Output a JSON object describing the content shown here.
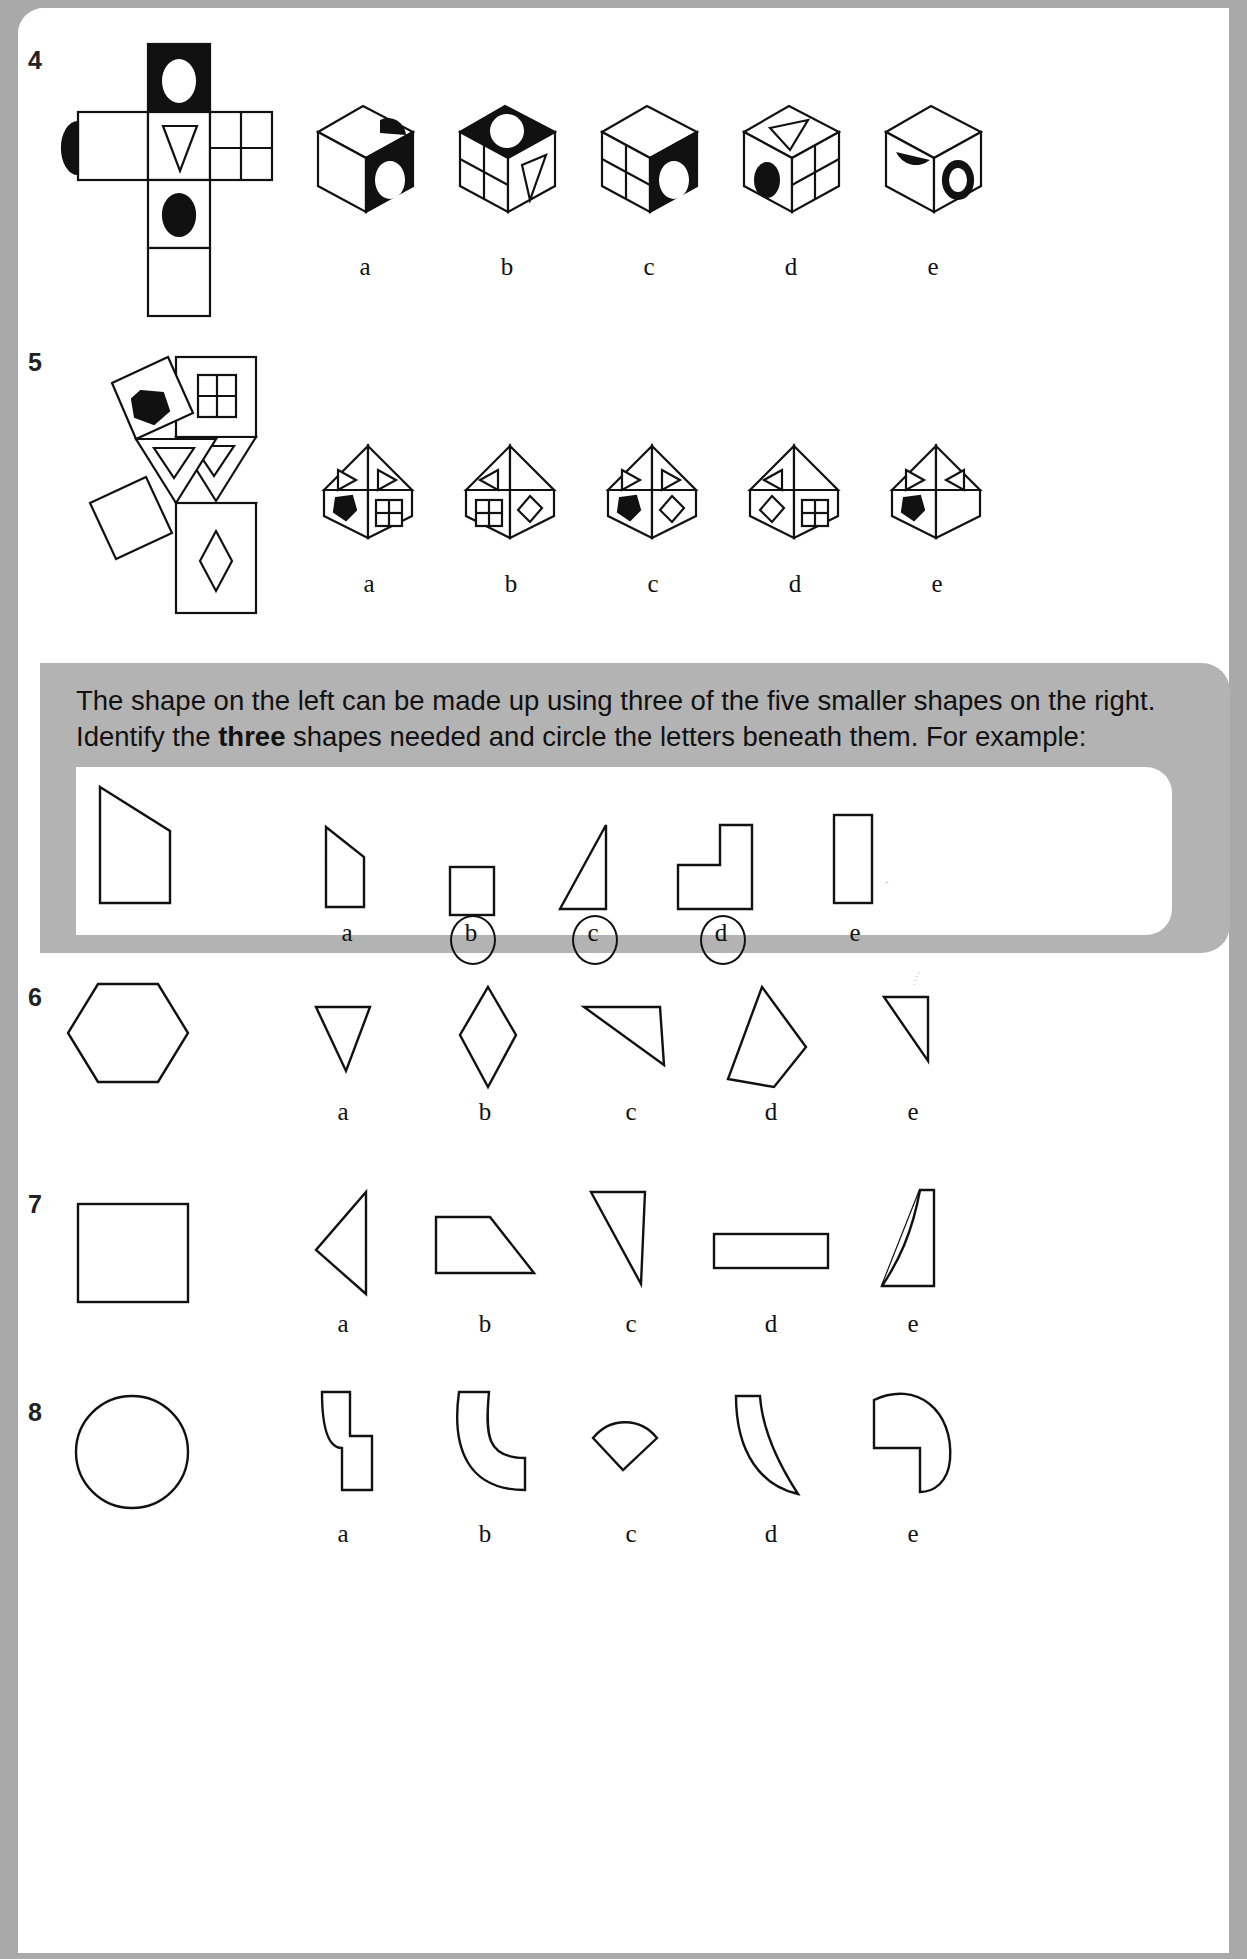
{
  "page": {
    "background_color": "#a9a9a9",
    "sheet_color": "#ffffff",
    "ink_color": "#111111"
  },
  "questions": [
    {
      "number": "4",
      "type": "cube-net-folding",
      "net": {
        "description": "cross-shaped cube net",
        "faces": [
          {
            "position": "top",
            "fill": "black",
            "motif": "white-ellipse"
          },
          {
            "position": "middle-left",
            "fill": "white",
            "motif": "black-half-ellipse-left-edge"
          },
          {
            "position": "middle-centre",
            "fill": "white",
            "motif": "outline-triangle-down"
          },
          {
            "position": "middle-right",
            "fill": "white",
            "motif": "four-pane-grid"
          },
          {
            "position": "lower-centre",
            "fill": "white",
            "motif": "black-ellipse"
          },
          {
            "position": "bottom-centre",
            "fill": "white",
            "motif": "blank"
          }
        ]
      },
      "options": [
        {
          "letter": "a",
          "top_face": "white with black half-circle at right",
          "left_face": "white blank",
          "right_face": "black with white ellipse"
        },
        {
          "letter": "b",
          "top_face": "black with white circle",
          "left_face": "white four-pane grid",
          "right_face": "white with outline triangle"
        },
        {
          "letter": "c",
          "top_face": "white blank",
          "left_face": "white four-pane grid",
          "right_face": "black with white ellipse"
        },
        {
          "letter": "d",
          "top_face": "white with outline triangle",
          "left_face": "white with black ellipse",
          "right_face": "white four-pane grid"
        },
        {
          "letter": "e",
          "top_face": "white with black half-circle",
          "left_face": "white blank",
          "right_face": "white with black ring ellipse"
        }
      ],
      "option_letters": [
        "a",
        "b",
        "c",
        "d",
        "e"
      ]
    },
    {
      "number": "5",
      "type": "octahedron-net-folding",
      "net": {
        "description": "net of square and triangle faces",
        "faces": [
          {
            "position": "upper-square",
            "motif": "four-pane-window"
          },
          {
            "position": "left-tilted-square",
            "motif": "black-hexagon"
          },
          {
            "position": "triangle-upper-right",
            "motif": "outline-triangle-down"
          },
          {
            "position": "triangle-centre",
            "motif": "outline-triangle-down"
          },
          {
            "position": "triangle-lower",
            "motif": "outline-triangle-down"
          },
          {
            "position": "lower-left-square",
            "motif": "blank"
          },
          {
            "position": "lower-right-square",
            "motif": "outline-diamond"
          }
        ]
      },
      "options": [
        {
          "letter": "a",
          "roof_left": "triangle pointing right",
          "roof_right": "triangle pointing right",
          "body_left": "black hexagon",
          "body_right": "four-pane window"
        },
        {
          "letter": "b",
          "roof_left": "triangle pointing left",
          "roof_right": "blank",
          "body_left": "four-pane window",
          "body_right": "outline diamond"
        },
        {
          "letter": "c",
          "roof_left": "triangle pointing right",
          "roof_right": "triangle pointing right",
          "body_left": "black hexagon",
          "body_right": "outline diamond"
        },
        {
          "letter": "d",
          "roof_left": "triangle pointing left",
          "roof_right": "blank",
          "body_left": "outline diamond",
          "body_right": "four-pane window"
        },
        {
          "letter": "e",
          "roof_left": "triangle pointing right",
          "roof_right": "triangle pointing left",
          "body_left": "black hexagon",
          "body_right": "blank"
        }
      ],
      "option_letters": [
        "a",
        "b",
        "c",
        "d",
        "e"
      ]
    },
    {
      "number": "6",
      "type": "shape-composition",
      "target_shape": "hexagon",
      "options": [
        {
          "letter": "a",
          "shape": "downward triangle"
        },
        {
          "letter": "b",
          "shape": "tall rhombus"
        },
        {
          "letter": "c",
          "shape": "thin scalene triangle"
        },
        {
          "letter": "d",
          "shape": "tall quadrilateral kite"
        },
        {
          "letter": "e",
          "shape": "right triangle"
        }
      ],
      "option_letters": [
        "a",
        "b",
        "c",
        "d",
        "e"
      ]
    },
    {
      "number": "7",
      "type": "shape-composition",
      "target_shape": "square",
      "options": [
        {
          "letter": "a",
          "shape": "leftward pointing triangle"
        },
        {
          "letter": "b",
          "shape": "right trapezium"
        },
        {
          "letter": "c",
          "shape": "right triangle apex top-left"
        },
        {
          "letter": "d",
          "shape": "long thin rectangle"
        },
        {
          "letter": "e",
          "shape": "hooked L-curve polygon"
        }
      ],
      "option_letters": [
        "a",
        "b",
        "c",
        "d",
        "e"
      ]
    },
    {
      "number": "8",
      "type": "shape-composition",
      "target_shape": "circle",
      "options": [
        {
          "letter": "a",
          "shape": "zig-zag stepped polygon"
        },
        {
          "letter": "b",
          "shape": "quarter-ring hook"
        },
        {
          "letter": "c",
          "shape": "small circular sector"
        },
        {
          "letter": "d",
          "shape": "crescent lens segment"
        },
        {
          "letter": "e",
          "shape": "three-quarter pac-man sector"
        }
      ],
      "option_letters": [
        "a",
        "b",
        "c",
        "d",
        "e"
      ]
    }
  ],
  "instruction": {
    "line1": "The shape on the left can be made up using three of the five smaller shapes on the",
    "line2_pre": "right. Identify the ",
    "line2_bold": "three",
    "line2_post": " shapes needed and circle the letters beneath them. For example:",
    "background_color": "#b3b3b3"
  },
  "example": {
    "target_shape": "large right-trapezium block",
    "options": [
      {
        "letter": "a",
        "shape": "small trapezium",
        "circled": false
      },
      {
        "letter": "b",
        "shape": "small rectangle",
        "circled": true
      },
      {
        "letter": "c",
        "shape": "thin right triangle",
        "circled": true
      },
      {
        "letter": "d",
        "shape": "L-shaped polygon",
        "circled": true
      },
      {
        "letter": "e",
        "shape": "tall narrow rectangle",
        "circled": false
      }
    ],
    "letters": [
      "a",
      "b",
      "c",
      "d",
      "e"
    ]
  }
}
